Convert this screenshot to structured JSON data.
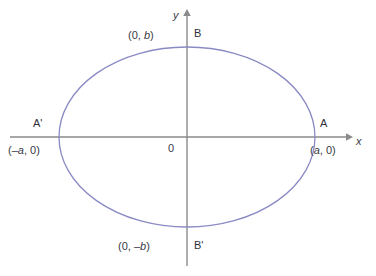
{
  "figure": {
    "colors": {
      "curve": "#8a8ac4",
      "axis": "#8a8a8a",
      "text": "#3a3a46",
      "background": "#ffffff"
    },
    "axes": {
      "x_label": "x",
      "y_label": "y",
      "origin_label": "0"
    },
    "vertices": [
      {
        "name": "B",
        "point_label": "(0, b)",
        "coord_text_plain": "(0, b)"
      },
      {
        "name": "B'",
        "point_label": "(0, –b)",
        "coord_text_plain": "(0, -b)"
      },
      {
        "name": "A",
        "point_label": "(a, 0)",
        "coord_text_plain": "(a, 0)"
      },
      {
        "name": "A'",
        "point_label": "(–a, 0)",
        "coord_text_plain": "(-a, 0)"
      }
    ],
    "labels": {
      "y_axis": "y",
      "x_axis": "x",
      "origin": "0",
      "vertex_top": "B",
      "vertex_bottom": "B'",
      "vertex_right": "A",
      "vertex_left": "A'",
      "coord_top": "(0, b)",
      "coord_bottom": "(0, –b)",
      "coord_right": "(a, 0)",
      "coord_left": "(–a, 0)"
    }
  },
  "chart_data": {
    "type": "line",
    "title": "",
    "xlabel": "x",
    "ylabel": "y",
    "grid": false,
    "legend": "none",
    "shape": "ellipse",
    "center": [
      0,
      0
    ],
    "semi_axis_x": "a",
    "semi_axis_y": "b",
    "equation": "x^2/a^2 + y^2/b^2 = 1",
    "annotations": [
      {
        "label": "B",
        "coord": "(0, b)",
        "position": "top"
      },
      {
        "label": "B'",
        "coord": "(0, -b)",
        "position": "bottom"
      },
      {
        "label": "A",
        "coord": "(a, 0)",
        "position": "right"
      },
      {
        "label": "A'",
        "coord": "(-a, 0)",
        "position": "left"
      },
      {
        "label": "0",
        "coord": "(0, 0)",
        "position": "origin"
      }
    ],
    "pixel_geometry": {
      "center_px": [
        187,
        137
      ],
      "radius_x_px": 128,
      "radius_y_px": 90,
      "x_axis_y_px": 137,
      "y_axis_x_px": 187
    }
  }
}
